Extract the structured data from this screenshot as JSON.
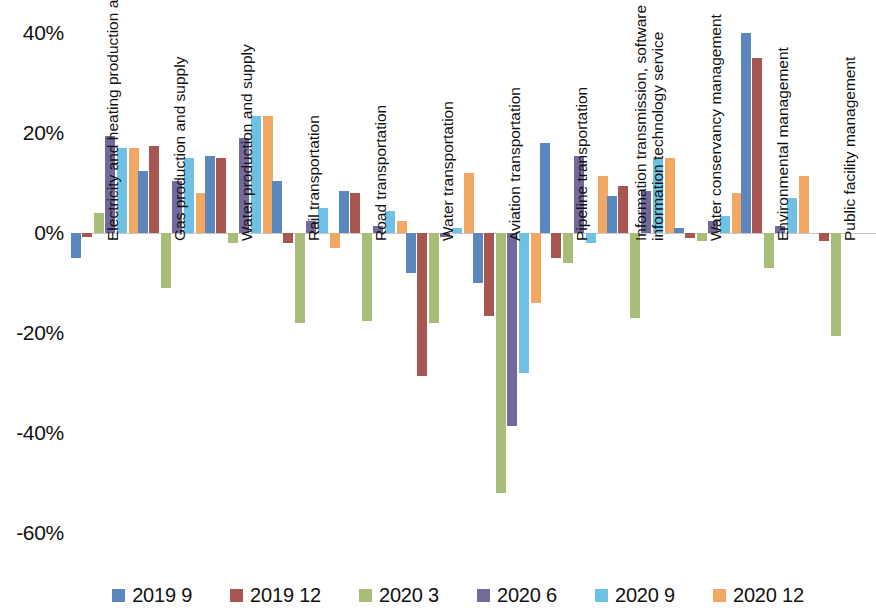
{
  "chart_data": {
    "type": "bar",
    "title": "",
    "subtitle": "",
    "xlabel": "",
    "ylabel": "",
    "ylim": [
      -65,
      45
    ],
    "grid": false,
    "legend_position": "bottom",
    "ytick_labels": [
      "40%",
      "20%",
      "0%",
      "-20%",
      "-40%",
      "-60%"
    ],
    "ytick_values": [
      40,
      20,
      0,
      -20,
      -40,
      -60
    ],
    "categories": [
      "Electricity and heating production and supply",
      "Gas production and supply",
      "Water production and supply",
      "Rail transportation",
      "Road transportation",
      "Water transportation",
      "Aviation transportation",
      "Pipeline transportation",
      "Information transmission, software and\ninformation technology service",
      "Water conservancy management",
      "Environmental management",
      "Public facility management"
    ],
    "series": [
      {
        "name": "2019 9",
        "color": "#5b87bf",
        "values": [
          -5.0,
          12.5,
          15.5,
          10.5,
          8.5,
          -8.0,
          -10.0,
          18.0,
          7.5,
          1.0,
          40.0,
          null
        ]
      },
      {
        "name": "2019 12",
        "color": "#a85650",
        "values": [
          -0.8,
          17.5,
          15.0,
          -2.0,
          8.0,
          -28.5,
          -16.5,
          -5.0,
          9.5,
          -1.0,
          35.0,
          -1.5
        ]
      },
      {
        "name": "2020 3",
        "color": "#a8bd78",
        "values": [
          4.0,
          -11.0,
          -2.0,
          -18.0,
          -17.5,
          -18.0,
          -52.0,
          -6.0,
          -17.0,
          -1.5,
          -7.0,
          -20.5
        ]
      },
      {
        "name": "2020 6",
        "color": "#74699c",
        "values": [
          19.5,
          10.5,
          19.0,
          2.5,
          1.5,
          -0.8,
          -38.5,
          15.5,
          8.5,
          2.5,
          1.5,
          null
        ]
      },
      {
        "name": "2020 9",
        "color": "#6fc1e3",
        "values": [
          17.0,
          15.0,
          23.5,
          5.0,
          4.5,
          1.0,
          -28.0,
          -2.0,
          15.0,
          3.5,
          7.0,
          null
        ]
      },
      {
        "name": "2020 12",
        "color": "#f2a863",
        "values": [
          17.0,
          8.0,
          23.5,
          -3.0,
          2.5,
          12.0,
          -14.0,
          11.5,
          15.0,
          8.0,
          11.5,
          null
        ]
      }
    ]
  }
}
